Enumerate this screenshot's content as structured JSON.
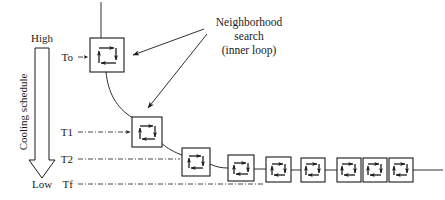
{
  "figure": {
    "kind": "simulated-annealing-cooling-schedule-diagram",
    "background_color": "#ffffff",
    "line_color": "#1a1a1a"
  },
  "axis": {
    "top_label": "High",
    "bottom_label": "Low",
    "vertical_label": "Cooling schedule",
    "arrow_direction": "down"
  },
  "temperature_levels": [
    {
      "label": "To",
      "y": 57,
      "dashed_from_x": 78,
      "dashed_to_x": 90
    },
    {
      "label": "T1",
      "y": 132,
      "dashed_from_x": 78,
      "dashed_to_x": 132
    },
    {
      "label": "T2",
      "y": 159,
      "dashed_from_x": 78,
      "dashed_to_x": 405
    },
    {
      "label": "Tf",
      "y": 184,
      "dashed_from_x": 78,
      "dashed_to_x": 405
    }
  ],
  "annotation": {
    "lines": [
      "Neighborhood",
      "search",
      "(inner loop)"
    ],
    "arrow_count": 2,
    "arrow_targets": [
      "box-0",
      "box-1"
    ]
  },
  "loop_boxes": [
    {
      "id": "box-0",
      "x": 90,
      "y": 38,
      "size": 34,
      "level": "To"
    },
    {
      "id": "box-1",
      "x": 132,
      "y": 117,
      "size": 30,
      "level": "T1"
    },
    {
      "id": "box-2",
      "x": 182,
      "y": 148,
      "size": 28,
      "level": "T2"
    },
    {
      "id": "box-3",
      "x": 228,
      "y": 155,
      "size": 26,
      "level": "T2"
    },
    {
      "id": "box-4",
      "x": 266,
      "y": 157,
      "size": 25,
      "level": "Tf"
    },
    {
      "id": "box-5",
      "x": 301,
      "y": 158,
      "size": 24,
      "level": "Tf"
    },
    {
      "id": "box-6",
      "x": 337,
      "y": 158,
      "size": 24,
      "level": "Tf"
    },
    {
      "id": "box-7",
      "x": 363,
      "y": 158,
      "size": 24,
      "level": "Tf"
    },
    {
      "id": "box-8",
      "x": 389,
      "y": 158,
      "size": 24,
      "level": "Tf"
    }
  ],
  "connectors": {
    "entry_line": {
      "from_x": 101,
      "from_y": 2,
      "to_y": 38
    },
    "exit_line": {
      "from_x": 413,
      "to_x": 443,
      "y": 170
    }
  },
  "icon_names": {
    "loop": "loop-cycle-icon",
    "axis_arrow": "down-arrow-icon",
    "pointer": "pointer-arrow-icon"
  }
}
